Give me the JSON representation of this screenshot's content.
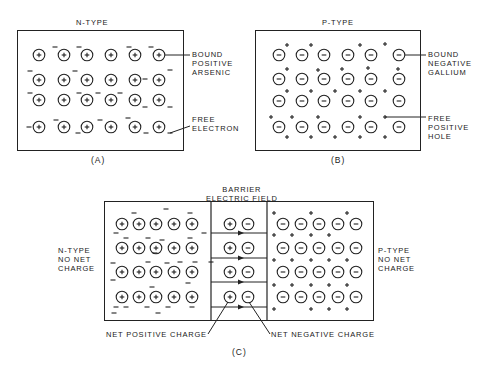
{
  "panel_a": {
    "title": "N-TYPE",
    "caption": "(A)",
    "label_bound": "BOUND\nPOSITIVE\nARSENIC",
    "label_free": "FREE\nELECTRON",
    "ion_symbol": "+",
    "carrier_symbol": "−",
    "grid": {
      "rows": 4,
      "cols": 6
    }
  },
  "panel_b": {
    "title": "P-TYPE",
    "caption": "(B)",
    "label_bound": "BOUND\nNEGATIVE\nGALLIUM",
    "label_free": "FREE\nPOSITIVE\nHOLE",
    "ion_symbol": "−",
    "carrier_symbol": "+",
    "grid": {
      "rows": 4,
      "cols": 6
    }
  },
  "panel_c": {
    "title": "BARRIER\nELECTRIC FIELD",
    "caption": "(C)",
    "label_left": "N-TYPE\nNO NET\nCHARGE",
    "label_right": "P-TYPE\nNO NET\nCHARGE",
    "label_net_positive": "NET POSITIVE CHARGE",
    "label_net_negative": "NET NEGATIVE CHARGE",
    "n_region_grid": {
      "rows": 4,
      "cols": 5
    },
    "p_region_grid": {
      "rows": 4,
      "cols": 5
    },
    "barrier_pairs": 4
  }
}
